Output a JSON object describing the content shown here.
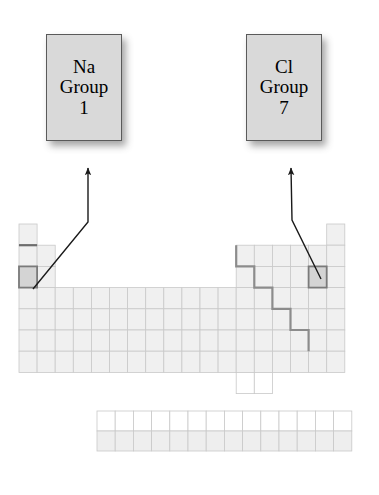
{
  "figure": {
    "kind": "periodic-table-annotated-diagram",
    "background_color": "#ffffff"
  },
  "callouts": [
    {
      "id": "na",
      "symbol": "Na",
      "group_word": "Group",
      "group_number": "1",
      "fill_color": "#d9d9d9",
      "border_color": "#5a5a5a",
      "x": 46,
      "y": 34,
      "w": 76,
      "h": 107
    },
    {
      "id": "cl",
      "symbol": "Cl",
      "group_word": "Group",
      "group_number": "7",
      "fill_color": "#d9d9d9",
      "border_color": "#5a5a5a",
      "x": 246,
      "y": 34,
      "w": 76,
      "h": 107
    }
  ],
  "arrows": [
    {
      "id": "arrow-na",
      "from_label": "sodium-cell",
      "to_label": "callout-na",
      "points": "33,289 88,222 88,168",
      "color": "#1a1a1a",
      "width": 1.4
    },
    {
      "id": "arrow-cl",
      "from_label": "chlorine-cell",
      "to_label": "callout-cl",
      "points": "321,279 292,220 291,168",
      "color": "#1a1a1a",
      "width": 1.4
    }
  ],
  "periodic_table": {
    "origin_x": 19,
    "origin_y": 224,
    "cell_w": 18.1,
    "cell_h": 21.2,
    "columns": 18,
    "rows": 7,
    "cell_fill": "#f0f0f0",
    "cell_fill_empty": "#ffffff",
    "cell_stroke": "#c9c9c9",
    "highlight_fill": "#d4d4d4",
    "highlight_stroke": "#7a7a7a",
    "divider_color": "#8c8c8c",
    "main_block": [
      {
        "row": 1,
        "cols": [
          1,
          18
        ]
      },
      {
        "row": 2,
        "cols": [
          1,
          2,
          13,
          14,
          15,
          16,
          17,
          18
        ]
      },
      {
        "row": 3,
        "cols": [
          1,
          2,
          13,
          14,
          15,
          16,
          17,
          18
        ]
      },
      {
        "row": 4,
        "cols": [
          1,
          2,
          3,
          4,
          5,
          6,
          7,
          8,
          9,
          10,
          11,
          12,
          13,
          14,
          15,
          16,
          17,
          18
        ]
      },
      {
        "row": 5,
        "cols": [
          1,
          2,
          3,
          4,
          5,
          6,
          7,
          8,
          9,
          10,
          11,
          12,
          13,
          14,
          15,
          16,
          17,
          18
        ]
      },
      {
        "row": 6,
        "cols": [
          1,
          2,
          3,
          4,
          5,
          6,
          7,
          8,
          9,
          10,
          11,
          12,
          13,
          14,
          15,
          16,
          17,
          18
        ]
      },
      {
        "row": 7,
        "cols": [
          1,
          2,
          3,
          4,
          5,
          6,
          7,
          8,
          9,
          10,
          11,
          12,
          13,
          14,
          15,
          16,
          17,
          18
        ]
      }
    ],
    "extra_cells": [
      {
        "row": 8,
        "col": 13
      },
      {
        "row": 8,
        "col": 14
      }
    ],
    "highlighted_cells": [
      {
        "id": "sodium-cell",
        "label": "Na",
        "row": 3,
        "col": 1
      },
      {
        "id": "chlorine-cell",
        "label": "Cl",
        "row": 3,
        "col": 17
      }
    ],
    "period1_rule": {
      "row": 1,
      "col": 1
    },
    "metalloid_staircase": "start-right-of-group12-row2 step down to group17-row6",
    "f_block": {
      "x": 97,
      "y": 411,
      "cell_w": 18.2,
      "cell_h": 20.0,
      "columns": 14,
      "rows": 2,
      "row_fills": [
        "#ffffff",
        "#eeeeee"
      ]
    }
  }
}
